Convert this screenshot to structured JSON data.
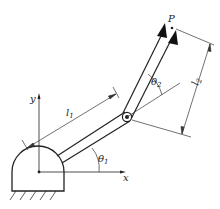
{
  "diagram": {
    "labels": {
      "endpoint": "P",
      "y_axis": "y",
      "x_axis": "x",
      "link1_length": "l",
      "link1_sub": "1",
      "link2_length": "l",
      "link2_sub": "2",
      "angle1": "θ",
      "angle1_sub": "1",
      "angle2": "θ",
      "angle2_sub": "2"
    },
    "colors": {
      "line": "#222222",
      "background": "#ffffff"
    }
  }
}
